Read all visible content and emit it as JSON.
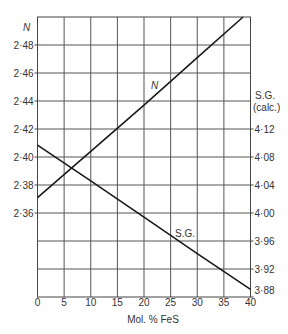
{
  "chart_data": {
    "type": "line",
    "title": "",
    "xlabel": "Mol. % FeS",
    "ylabel_left": "N",
    "ylabel_right": "S.G. (calc.)",
    "ylabel_right_line1": "S.G.",
    "ylabel_right_line2": "(calc.)",
    "xlim": [
      0,
      40
    ],
    "ylim_left": [
      2.3,
      2.5
    ],
    "ylim_right": [
      3.88,
      4.16
    ],
    "grid": true,
    "legend_position": "none (inline labels)",
    "x_ticks": [
      "0",
      "5",
      "10",
      "15",
      "20",
      "25",
      "30",
      "35",
      "40"
    ],
    "x_tick_values": [
      0,
      5,
      10,
      15,
      20,
      25,
      30,
      35,
      40
    ],
    "y_left_ticks": [
      "2·48",
      "2·46",
      "2·44",
      "2·42",
      "2·40",
      "2·38",
      "2·36"
    ],
    "y_left_tick_values": [
      2.48,
      2.46,
      2.44,
      2.42,
      2.4,
      2.38,
      2.36
    ],
    "y_right_ticks": [
      "4·12",
      "4·08",
      "4·04",
      "4·00",
      "3·96",
      "3·92",
      "3·88"
    ],
    "y_right_tick_values": [
      4.12,
      4.08,
      4.04,
      4.0,
      3.96,
      3.92,
      3.88
    ],
    "series": [
      {
        "name": "N",
        "label": "N",
        "axis": "left",
        "x": [
          0,
          10,
          20,
          30,
          38.6
        ],
        "values": [
          2.371,
          2.404,
          2.437,
          2.471,
          2.5
        ]
      },
      {
        "name": "S.G.",
        "label": "S.G.",
        "axis": "right",
        "x": [
          0,
          10,
          20,
          30,
          40
        ],
        "values": [
          4.097,
          4.046,
          3.994,
          3.942,
          3.891
        ]
      }
    ]
  }
}
